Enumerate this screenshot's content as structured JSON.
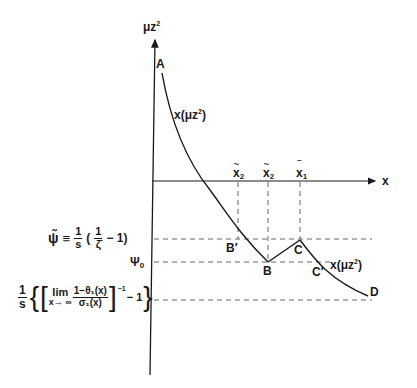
{
  "diagram": {
    "y_axis_label": "μz",
    "y_axis_label_sup": "2",
    "x_axis_label": "x",
    "curve_label_upper": "x(μz",
    "curve_label_upper_sup": "2",
    "curve_label_upper_close": ")",
    "curve_label_lower": "x(μz",
    "curve_label_lower_sup": "2",
    "curve_label_lower_close": ")",
    "points": {
      "A": "A",
      "B_prime": "B′",
      "B": "B",
      "C": "C",
      "C_prime": "C′",
      "D": "D"
    },
    "x_ticks": [
      {
        "base": "x",
        "mark": "~",
        "sub": "2",
        "x": 238
      },
      {
        "base": "x",
        "mark": "~",
        "sub": "2",
        "x": 268
      },
      {
        "base": "x",
        "mark": "‾",
        "sub": "1",
        "x": 300
      }
    ],
    "y_levels": {
      "psi_tilde": {
        "lhs": "ψ̃",
        "equiv": "≡",
        "coef_num": "1",
        "coef_den": "s",
        "open": "(",
        "inner_num": "1",
        "inner_den": "ζ̄",
        "minus_one": "− 1)",
        "y": 239
      },
      "psi_0": {
        "label": "Ψ",
        "sub": "0",
        "y": 262
      },
      "limit_level": {
        "coef_num": "1",
        "coef_den": "s",
        "open_brace": "{",
        "open_bracket": "[",
        "lim": "lim",
        "lim_under": "x→ ∞",
        "frac_num": "1−θ₁(x)",
        "frac_den": "σ₁(x)",
        "close_bracket": "]",
        "exponent": "−1",
        "minus_one": "− 1",
        "close_brace": "}",
        "y": 300
      }
    }
  }
}
